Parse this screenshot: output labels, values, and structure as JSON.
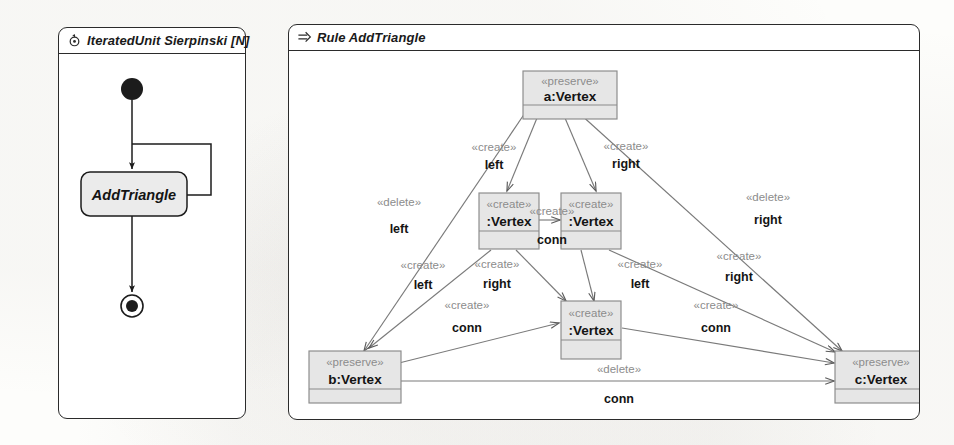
{
  "unit_panel": {
    "icon": "iterated-unit-icon",
    "title": "IteratedUnit Sierpinski [N]",
    "activity": {
      "initial_node": "initial-node",
      "action_label": "AddTriangle",
      "final_node": "final-node"
    }
  },
  "rule_panel": {
    "icon": "rule-arrow-icon",
    "title": "Rule AddTriangle",
    "nodes": [
      {
        "id": "a",
        "stereotype": "«preserve»",
        "name": "a:Vertex"
      },
      {
        "id": "v1",
        "stereotype": "«create»",
        "name": ":Vertex"
      },
      {
        "id": "v2",
        "stereotype": "«create»",
        "name": ":Vertex"
      },
      {
        "id": "v3",
        "stereotype": "«create»",
        "name": ":Vertex"
      },
      {
        "id": "b",
        "stereotype": "«preserve»",
        "name": "b:Vertex"
      },
      {
        "id": "c",
        "stereotype": "«preserve»",
        "name": "c:Vertex"
      }
    ],
    "edges": [
      {
        "id": "e1",
        "from": "a",
        "to": "v1",
        "stereotype": "«create»",
        "name": "left"
      },
      {
        "id": "e2",
        "from": "a",
        "to": "v2",
        "stereotype": "«create»",
        "name": "right"
      },
      {
        "id": "e3",
        "from": "a",
        "to": "b",
        "stereotype": "«delete»",
        "name": "left"
      },
      {
        "id": "e4",
        "from": "a",
        "to": "c",
        "stereotype": "«delete»",
        "name": "right"
      },
      {
        "id": "e5",
        "from": "v1",
        "to": "v2",
        "stereotype": "«create»",
        "name": "conn"
      },
      {
        "id": "e6",
        "from": "v1",
        "to": "b",
        "stereotype": "«create»",
        "name": "left"
      },
      {
        "id": "e7",
        "from": "v1",
        "to": "v3",
        "stereotype": "«create»",
        "name": "right"
      },
      {
        "id": "e8",
        "from": "v2",
        "to": "v3",
        "stereotype": "«create»",
        "name": "left"
      },
      {
        "id": "e9",
        "from": "v2",
        "to": "c",
        "stereotype": "«create»",
        "name": "right"
      },
      {
        "id": "e10",
        "from": "b",
        "to": "v3",
        "stereotype": "«create»",
        "name": "conn"
      },
      {
        "id": "e11",
        "from": "v3",
        "to": "c",
        "stereotype": "«create»",
        "name": "conn"
      },
      {
        "id": "e12",
        "from": "b",
        "to": "c",
        "stereotype": "«delete»",
        "name": "conn"
      }
    ]
  },
  "colors": {
    "node_fill": "#e6e6e6",
    "node_border": "#8a8a8a",
    "stereotype_text": "#8c8c8c",
    "name_text": "#141414",
    "edge_line": "#6e6e6e",
    "panel_border": "#2b2b2b",
    "page_bg": "#fdfdfb"
  }
}
